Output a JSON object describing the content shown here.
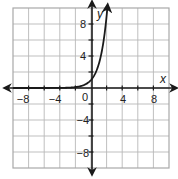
{
  "chart_data": {
    "type": "line",
    "title": "",
    "xlabel": "x",
    "ylabel": "y",
    "xlim": [
      -10,
      10
    ],
    "ylim": [
      -10,
      10
    ],
    "grid": true,
    "grid_step": 2,
    "x_ticks": [
      -8,
      -4,
      0,
      4,
      8
    ],
    "y_ticks": [
      8,
      4,
      -4,
      -8
    ],
    "origin_label": "0",
    "series": [
      {
        "name": "y = 3^x",
        "function": "3^x",
        "x": [
          -10,
          -4,
          -2,
          -1,
          0,
          1,
          1.5,
          2,
          2.1
        ],
        "values": [
          0,
          0.01,
          0.11,
          0.33,
          1,
          3,
          5.2,
          9,
          10
        ]
      }
    ]
  },
  "labels": {
    "x_axis": "x",
    "y_axis": "y",
    "origin": "0",
    "xt_m8": "−8",
    "xt_m4": "−4",
    "xt_4": "4",
    "xt_8": "8",
    "yt_8": "8",
    "yt_4": "4",
    "yt_m4": "−4",
    "yt_m8": "−8"
  },
  "colors": {
    "grid": "#b8b8b8",
    "axis": "#1a1a1a",
    "curve": "#1a1a1a"
  }
}
